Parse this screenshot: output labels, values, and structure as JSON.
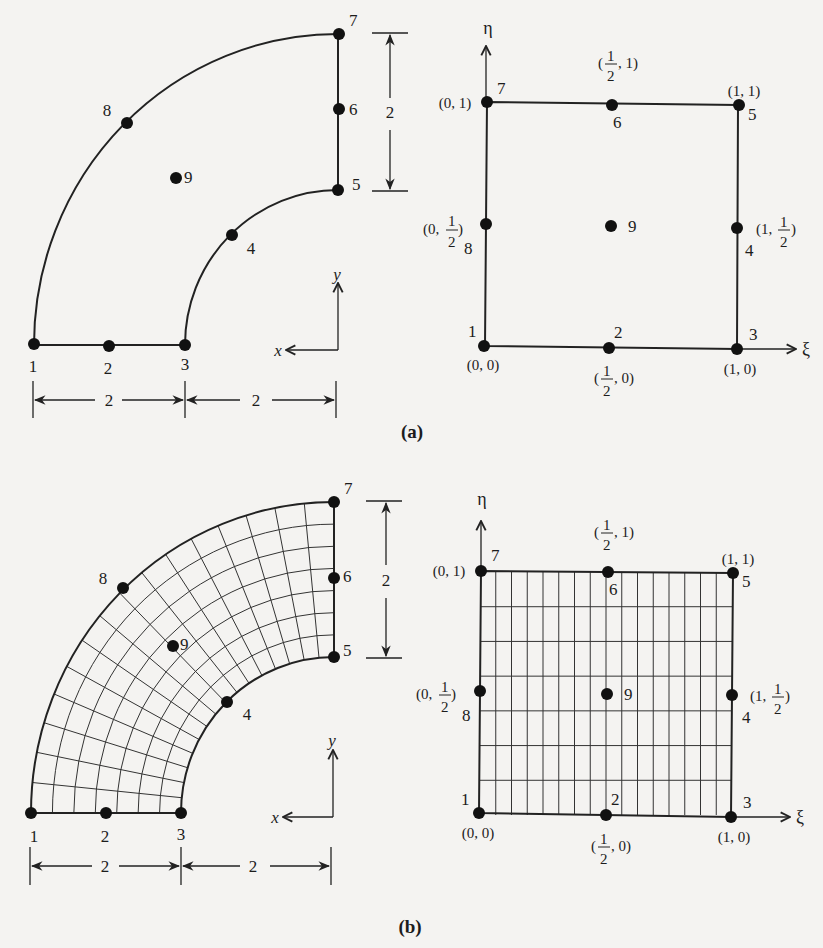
{
  "figure": {
    "panels": [
      {
        "id": "a",
        "label": "(a)",
        "physical": {
          "description": "Quarter-annulus 9-node element in x-y space",
          "axes": {
            "x": "x",
            "y": "y"
          },
          "inner_radius": 2,
          "outer_radius": 4,
          "dimensions": [
            "2",
            "2",
            "2"
          ],
          "nodes": [
            "1",
            "2",
            "3",
            "4",
            "5",
            "6",
            "7",
            "8",
            "9"
          ],
          "mesh": false
        },
        "parent": {
          "description": "Unit square in xi-eta space",
          "axes": {
            "xi": "ξ",
            "eta": "η"
          },
          "nodes": [
            {
              "id": "1",
              "coord": "(0, 0)"
            },
            {
              "id": "2",
              "coord_pre": "(",
              "num": "1",
              "den": "2",
              "coord_post": ", 0)"
            },
            {
              "id": "3",
              "coord": "(1, 0)"
            },
            {
              "id": "4",
              "coord_pre": "(1, ",
              "num": "1",
              "den": "2",
              "coord_post": ")"
            },
            {
              "id": "5",
              "coord": "(1, 1)"
            },
            {
              "id": "6",
              "coord_pre": "(",
              "num": "1",
              "den": "2",
              "coord_post": ", 1)"
            },
            {
              "id": "7",
              "coord": "(0, 1)"
            },
            {
              "id": "8",
              "coord_pre": "(0, ",
              "num": "1",
              "den": "2",
              "coord_post": ")"
            },
            {
              "id": "9",
              "coord": ""
            }
          ],
          "mesh": false
        }
      },
      {
        "id": "b",
        "label": "(b)",
        "physical": {
          "description": "Quarter-annulus element with mapped mesh",
          "axes": {
            "x": "x",
            "y": "y"
          },
          "dimensions": [
            "2",
            "2",
            "2"
          ],
          "nodes": [
            "1",
            "2",
            "3",
            "4",
            "5",
            "6",
            "7",
            "8",
            "9"
          ],
          "mesh": {
            "radial_divisions": 7,
            "angular_divisions": 16
          }
        },
        "parent": {
          "description": "Unit square with uniform grid",
          "axes": {
            "xi": "ξ",
            "eta": "η"
          },
          "nodes": [
            {
              "id": "1",
              "coord": "(0, 0)"
            },
            {
              "id": "2",
              "coord_pre": "(",
              "num": "1",
              "den": "2",
              "coord_post": ", 0)"
            },
            {
              "id": "3",
              "coord": "(1, 0)"
            },
            {
              "id": "4",
              "coord_pre": "(1, ",
              "num": "1",
              "den": "2",
              "coord_post": ")"
            },
            {
              "id": "5",
              "coord": "(1, 1)"
            },
            {
              "id": "6",
              "coord_pre": "(",
              "num": "1",
              "den": "2",
              "coord_post": ", 1)"
            },
            {
              "id": "7",
              "coord": "(0, 1)"
            },
            {
              "id": "8",
              "coord_pre": "(0, ",
              "num": "1",
              "den": "2",
              "coord_post": ")"
            },
            {
              "id": "9",
              "coord": ""
            }
          ],
          "mesh": {
            "xi_divisions": 16,
            "eta_divisions": 7
          }
        }
      }
    ]
  }
}
